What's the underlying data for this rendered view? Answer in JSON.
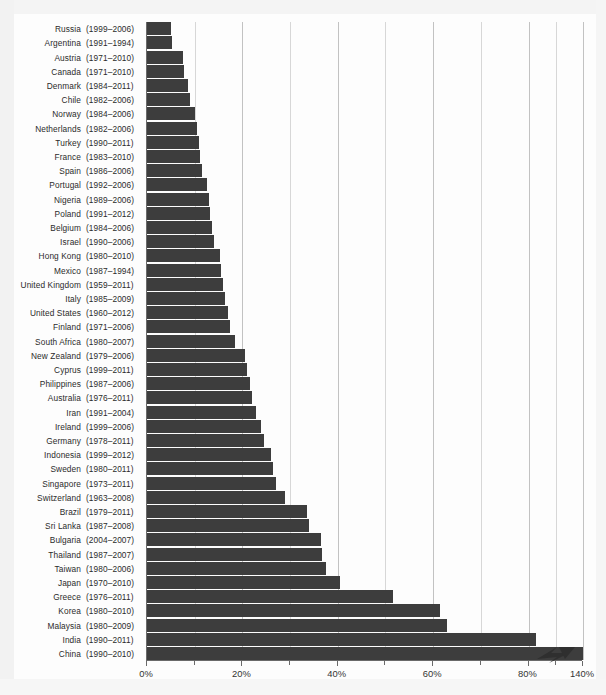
{
  "chart_data": {
    "type": "bar",
    "orientation": "horizontal",
    "title": "",
    "subtitle": "",
    "xlabel": "",
    "ylabel": "",
    "xlim": [
      0,
      140
    ],
    "grid": true,
    "legend": null,
    "axis_break": {
      "present": true,
      "after_tick": "80%",
      "next_tick": "140%",
      "marker": "zigzag"
    },
    "xticks": [
      "0%",
      "20%",
      "40%",
      "60%",
      "80%",
      "140%"
    ],
    "xtick_values": [
      0,
      20,
      40,
      60,
      80,
      140
    ],
    "minor_gridline_values": [
      10,
      30,
      50,
      70,
      110
    ],
    "bar_color": "#3d3d3d",
    "categories": [
      "Russia",
      "Argentina",
      "Austria",
      "Canada",
      "Denmark",
      "Chile",
      "Norway",
      "Netherlands",
      "Turkey",
      "France",
      "Spain",
      "Portugal",
      "Nigeria",
      "Poland",
      "Belgium",
      "Israel",
      "Hong Kong",
      "Mexico",
      "United Kingdom",
      "Italy",
      "United States",
      "Finland",
      "South Africa",
      "New Zealand",
      "Cyprus",
      "Philippines",
      "Australia",
      "Iran",
      "Ireland",
      "Germany",
      "Indonesia",
      "Sweden",
      "Singapore",
      "Switzerland",
      "Brazil",
      "Sri Lanka",
      "Bulgaria",
      "Thailand",
      "Taiwan",
      "Japan",
      "Greece",
      "Korea",
      "Malaysia",
      "India",
      "China"
    ],
    "period_labels": [
      "(1999–2006)",
      "(1991–1994)",
      "(1971–2010)",
      "(1971–2010)",
      "(1984–2011)",
      "(1982–2006)",
      "(1984–2006)",
      "(1982–2006)",
      "(1990–2011)",
      "(1983–2010)",
      "(1986–2006)",
      "(1992–2006)",
      "(1989–2006)",
      "(1991–2012)",
      "(1984–2006)",
      "(1990–2006)",
      "(1980–2010)",
      "(1987–1994)",
      "(1959–2011)",
      "(1985–2009)",
      "(1960–2012)",
      "(1971–2006)",
      "(1980–2007)",
      "(1979–2006)",
      "(1999–2011)",
      "(1987–2006)",
      "(1976–2011)",
      "(1991–2004)",
      "(1999–2006)",
      "(1978–2011)",
      "(1999–2012)",
      "(1980–2011)",
      "(1973–2011)",
      "(1963–2008)",
      "(1979–2011)",
      "(1987–2008)",
      "(2004–2007)",
      "(1987–2007)",
      "(1980–2006)",
      "(1970–2010)",
      "(1976–2011)",
      "(1980–2010)",
      "(1980–2009)",
      "(1990–2011)",
      "(1990–2010)"
    ],
    "values": [
      5.0,
      5.2,
      7.5,
      7.8,
      8.6,
      9.0,
      10.0,
      10.5,
      11.0,
      11.2,
      11.5,
      12.5,
      13.0,
      13.3,
      13.6,
      14.0,
      15.3,
      15.6,
      16.0,
      16.3,
      17.0,
      17.5,
      18.5,
      20.5,
      21.0,
      21.5,
      22.0,
      22.8,
      24.0,
      24.6,
      26.0,
      26.5,
      27.0,
      29.0,
      33.5,
      34.0,
      36.5,
      36.8,
      37.5,
      40.5,
      51.5,
      61.5,
      63.0,
      88.0,
      140.0
    ],
    "value_unit": "%",
    "overflow_series": [
      "China"
    ]
  }
}
